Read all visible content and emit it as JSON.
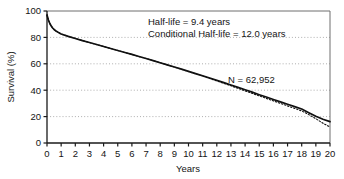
{
  "chart_data": {
    "type": "line",
    "title": "",
    "xlabel": "Years",
    "ylabel": "Survival (%)",
    "xlim": [
      0,
      20
    ],
    "ylim": [
      0,
      100
    ],
    "grid": "horizontal-dotted",
    "legend": "none",
    "xticks": [
      "0",
      "1",
      "2",
      "3",
      "4",
      "5",
      "6",
      "7",
      "8",
      "9",
      "10",
      "11",
      "12",
      "13",
      "14",
      "15",
      "16",
      "17",
      "18",
      "19",
      "20"
    ],
    "yticks": [
      "0",
      "20",
      "40",
      "60",
      "80",
      "100"
    ],
    "annotations": [
      {
        "name": "half-life",
        "text": "Half-life = 9.4 years"
      },
      {
        "name": "conditional-half-life",
        "text": "Conditional Half-life = 12.0 years"
      },
      {
        "name": "sample-size",
        "text": "N = 62,952"
      }
    ],
    "series": [
      {
        "name": "observed-survival",
        "style": "solid",
        "color": "#111111",
        "x": [
          0,
          0.1,
          0.2,
          0.3,
          0.4,
          0.5,
          0.6,
          0.7,
          0.8,
          0.9,
          1,
          1.5,
          2,
          2.5,
          3,
          3.5,
          4,
          4.5,
          5,
          5.5,
          6,
          6.5,
          7,
          7.5,
          8,
          8.5,
          9,
          9.5,
          10,
          10.5,
          11,
          11.5,
          12,
          12.5,
          13,
          13.5,
          14,
          14.5,
          15,
          15.5,
          16,
          16.5,
          17,
          17.5,
          18,
          18.5,
          19,
          19.5,
          20
        ],
        "values": [
          97,
          93.2,
          90.5,
          88.6,
          87.1,
          86,
          85.1,
          84.4,
          83.8,
          83.2,
          82.6,
          80.8,
          79.2,
          77.6,
          76.1,
          74.6,
          73.1,
          71.6,
          70.1,
          68.6,
          67.1,
          65.5,
          64,
          62.4,
          60.8,
          59.2,
          57.6,
          56,
          54.3,
          52.6,
          50.9,
          49.2,
          47.5,
          45.7,
          43.9,
          42.1,
          40.3,
          38.5,
          36.6,
          34.8,
          33,
          31.2,
          29.4,
          27.6,
          25.8,
          23,
          20.3,
          18,
          16.2
        ]
      },
      {
        "name": "projected-survival",
        "style": "dotted",
        "color": "#111111",
        "x": [
          0,
          0.1,
          0.2,
          0.3,
          0.4,
          0.5,
          0.6,
          0.7,
          0.8,
          0.9,
          1,
          1.5,
          2,
          2.5,
          3,
          3.5,
          4,
          4.5,
          5,
          5.5,
          6,
          6.5,
          7,
          7.5,
          8,
          8.5,
          9,
          9.5,
          10,
          10.5,
          11,
          11.5,
          12,
          12.5,
          13,
          13.5,
          14,
          14.5,
          15,
          15.5,
          16,
          16.5,
          17,
          17.5,
          18,
          18.5,
          19,
          19.5,
          20
        ],
        "values": [
          97,
          93.2,
          90.5,
          88.6,
          87.1,
          86,
          85.1,
          84.4,
          83.8,
          83.2,
          82.6,
          80.8,
          79.2,
          77.6,
          76.1,
          74.6,
          73.1,
          71.6,
          70.1,
          68.6,
          67.1,
          65.5,
          64,
          62.4,
          60.8,
          59.2,
          57.6,
          55.9,
          54.2,
          52.4,
          50.6,
          48.8,
          47,
          45.2,
          43.3,
          41.4,
          39.5,
          37.6,
          35.7,
          33.8,
          31.9,
          30,
          28.1,
          26.2,
          24.3,
          21.5,
          18.4,
          15,
          12.1
        ]
      }
    ]
  }
}
